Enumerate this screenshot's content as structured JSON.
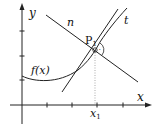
{
  "diagram": {
    "axes": {
      "x_label": "x",
      "y_label": "y"
    },
    "labels": {
      "curve": "f(x)",
      "normal": "n",
      "tangent": "t",
      "point": "P",
      "point_sub": "1",
      "x_marker": "x",
      "x_marker_sub": "1",
      "right_angle_dot": "·"
    },
    "colors": {
      "stroke": "#222222",
      "background": "#ffffff",
      "dotted": "#888888"
    }
  }
}
